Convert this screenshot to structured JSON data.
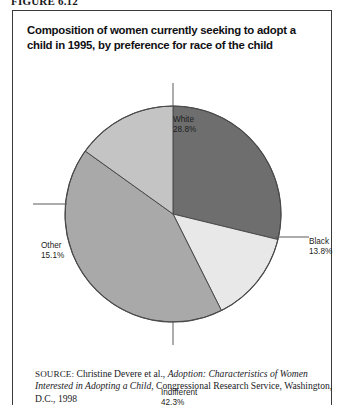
{
  "figure": {
    "number_label": "FIGURE 6.12"
  },
  "chart_title": "Composition of women currently seeking to adopt a child in 1995, by preference for race of the child",
  "labels": {
    "white": {
      "name": "White",
      "pct": "28.8%"
    },
    "black": {
      "name": "Black",
      "pct": "13.8%"
    },
    "other": {
      "name": "Other",
      "pct": "15.1%"
    },
    "indifferent": {
      "name": "Indifferent",
      "pct": "42.3%"
    }
  },
  "source": {
    "label": "SOURCE:",
    "author": " Christine Devere et al., ",
    "title_italic": "Adoption: Characteristics of Women Interested in Adopting a Child",
    "publisher": ", Congressional Research Service, Washington, D.C., 1998"
  },
  "chart_data": {
    "type": "pie",
    "title": "Composition of women currently seeking to adopt a child in 1995, by preference for race of the child",
    "categories": [
      "White",
      "Black",
      "Indifferent",
      "Other"
    ],
    "values": [
      28.8,
      13.8,
      42.3,
      15.1
    ],
    "unit": "percent",
    "total": 100.0,
    "start_angle_deg": 0,
    "direction": "clockwise",
    "legend": "none",
    "data_labels": [
      "White 28.8%",
      "Black 13.8%",
      "Indifferent 42.3%",
      "Other 15.1%"
    ],
    "slice_colors": [
      "#6e6e6e",
      "#e8e8e8",
      "#a9a9a9",
      "#c4c4c4"
    ],
    "border_color": "#4a4a4a",
    "leader_lines": true,
    "grid": false
  },
  "colors": {
    "slice_white": "#6e6e6e",
    "slice_black": "#e8e8e8",
    "slice_indifferent": "#a9a9a9",
    "slice_other": "#c4c4c4",
    "outline": "#4a4a4a",
    "frame": "#3a3a3a"
  }
}
